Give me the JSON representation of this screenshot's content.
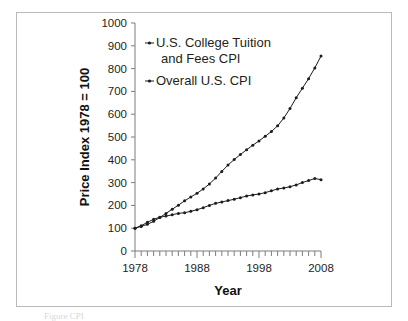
{
  "figure": {
    "frame_border_color": "#b9b9b9",
    "background": "#ffffff",
    "ink_color": "#1c1c1c",
    "axis_color": "#7d7d7d",
    "caption_fragment": "Figure    CPI"
  },
  "chart_data": {
    "type": "line",
    "title": "",
    "xlabel": "Year",
    "ylabel": "Price Index 1978 = 100",
    "xlim": [
      1978,
      2008
    ],
    "ylim": [
      0,
      1000
    ],
    "yticks": [
      0,
      100,
      200,
      300,
      400,
      500,
      600,
      700,
      800,
      900,
      1000
    ],
    "ytick_labels": [
      "0",
      "100",
      "200",
      "300",
      "400",
      "500",
      "600",
      "700",
      "800",
      "900",
      "1000"
    ],
    "xticks": [
      1978,
      1988,
      1998,
      2008
    ],
    "xtick_labels": [
      "1978",
      "1988",
      "1998",
      "2008"
    ],
    "x_minor_tick_interval": 1,
    "grid": false,
    "legend_position": "upper-left-inside",
    "marker": "small-filled-dot",
    "x": [
      1978,
      1979,
      1980,
      1981,
      1982,
      1983,
      1984,
      1985,
      1986,
      1987,
      1988,
      1989,
      1990,
      1991,
      1992,
      1993,
      1994,
      1995,
      1996,
      1997,
      1998,
      1999,
      2000,
      2001,
      2002,
      2003,
      2004,
      2005,
      2006,
      2007,
      2008
    ],
    "series": [
      {
        "name": "U.S. College Tuition and Fees CPI",
        "values": [
          100,
          108,
          117,
          130,
          147,
          165,
          183,
          201,
          220,
          237,
          253,
          272,
          294,
          320,
          349,
          377,
          401,
          423,
          444,
          464,
          483,
          503,
          524,
          549,
          583,
          625,
          672,
          714,
          756,
          803,
          855
        ]
      },
      {
        "name": "Overall U.S. CPI",
        "values": [
          100,
          111,
          126,
          139,
          148,
          153,
          159,
          165,
          168,
          174,
          181,
          190,
          200,
          209,
          215,
          221,
          227,
          234,
          241,
          246,
          250,
          256,
          264,
          272,
          276,
          282,
          290,
          300,
          309,
          318,
          313
        ]
      }
    ]
  },
  "legend": {
    "entries": [
      {
        "label_line1": "U.S. College Tuition",
        "label_line2": "and Fees CPI"
      },
      {
        "label_line1": "Overall U.S. CPI",
        "label_line2": ""
      }
    ]
  }
}
